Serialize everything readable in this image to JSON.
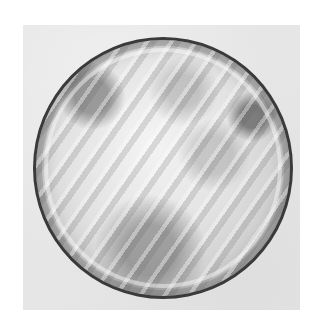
{
  "image": {
    "subject": "blastocyst-embryo-microscopy",
    "background_color": "#ffffff",
    "frame_color": "#e6e6e6",
    "embryo_border_color": "#3a3a3a"
  }
}
